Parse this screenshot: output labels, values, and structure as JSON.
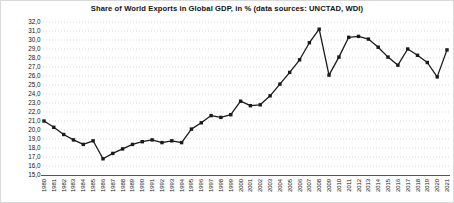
{
  "chart_data": {
    "type": "line",
    "title": "Share of World Exports in Global GDP, in % (data sources: UNCTAD, WDI)",
    "series_name": "Share of world exports in global GDP (%)",
    "x": [
      1980,
      1981,
      1982,
      1983,
      1984,
      1985,
      1986,
      1987,
      1988,
      1989,
      1990,
      1991,
      1992,
      1993,
      1994,
      1995,
      1996,
      1997,
      1998,
      1999,
      2000,
      2001,
      2002,
      2003,
      2004,
      2005,
      2006,
      2007,
      2008,
      2009,
      2010,
      2011,
      2012,
      2013,
      2014,
      2015,
      2016,
      2017,
      2018,
      2019,
      2020,
      2021
    ],
    "values": [
      21.0,
      20.3,
      19.5,
      18.9,
      18.4,
      18.8,
      16.8,
      17.4,
      17.9,
      18.4,
      18.7,
      18.9,
      18.6,
      18.8,
      18.6,
      20.1,
      20.8,
      21.6,
      21.4,
      21.7,
      23.2,
      22.7,
      22.8,
      23.8,
      25.1,
      26.4,
      27.8,
      29.7,
      31.2,
      26.1,
      28.1,
      30.3,
      30.4,
      30.1,
      29.2,
      28.1,
      27.2,
      29.0,
      28.3,
      27.5,
      25.9,
      28.9
    ],
    "xlabel": "",
    "ylabel": "",
    "ylim": [
      15.0,
      32.0
    ],
    "y_tick_step": 1.0,
    "y_tick_labels": [
      "32,0",
      "31,0",
      "30,0",
      "29,0",
      "28,0",
      "27,0",
      "26,0",
      "25,0",
      "24,0",
      "23,0",
      "22,0",
      "21,0",
      "20,0",
      "19,0",
      "18,0",
      "17,0",
      "16,0",
      "15,0"
    ],
    "decimal_separator": ",",
    "grid": "horizontal-dotted",
    "legend": "none",
    "line_color": "#1a1a1a",
    "marker": "square",
    "marker_color": "#1a1a1a",
    "gridline_color": "#c9c9c9",
    "axis_color": "#555555",
    "background_color": "#ffffff"
  }
}
